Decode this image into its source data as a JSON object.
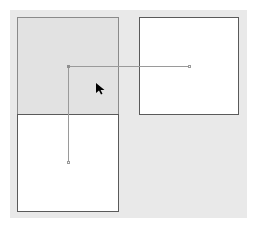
{
  "canvas": {
    "background": "#e9e9e9",
    "bounds": {
      "x": 10,
      "y": 10,
      "w": 237,
      "h": 208
    }
  },
  "boxes": [
    {
      "id": "box-top-left",
      "x": 17,
      "y": 17,
      "w": 102,
      "h": 98,
      "fill": "#e2e2e2",
      "state": "selected"
    },
    {
      "id": "box-top-right",
      "x": 139,
      "y": 17,
      "w": 100,
      "h": 98,
      "fill": "#ffffff",
      "state": "normal"
    },
    {
      "id": "box-bottom-left",
      "x": 17,
      "y": 114,
      "w": 102,
      "h": 98,
      "fill": "#ffffff",
      "state": "normal"
    }
  ],
  "connectors": {
    "origin": {
      "x": 67,
      "y": 65
    },
    "horizontal": {
      "from_x": 68,
      "to_x": 189,
      "y": 66
    },
    "vertical": {
      "x": 68,
      "from_y": 66,
      "to_y": 162
    }
  },
  "cursor": {
    "icon": "arrow-pointer-icon",
    "x": 96,
    "y": 84,
    "color": "#000000"
  }
}
